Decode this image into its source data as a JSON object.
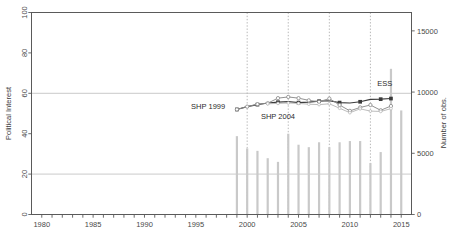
{
  "chart_data": {
    "type": "line",
    "title": "",
    "xlabel": "",
    "ylabel": "Political Interest",
    "y2label": "Number of obs.",
    "xlim": [
      1979,
      2016
    ],
    "ylim": [
      0,
      100
    ],
    "y2lim": [
      0,
      16500
    ],
    "grid": "horizontal solid at 20/60/100; vertical dashed at 2000/2004/2008/2012",
    "legend": "none (inline annotations)",
    "xticks": [
      1980,
      1985,
      1990,
      1995,
      2000,
      2005,
      2010,
      2015
    ],
    "xticks_minor": [
      1981,
      1982,
      1983,
      1984,
      1986,
      1987,
      1988,
      1989,
      1991,
      1992,
      1993,
      1994,
      1996,
      1997,
      1998,
      1999,
      2001,
      2002,
      2003,
      2004,
      2006,
      2007,
      2008,
      2009,
      2011,
      2012,
      2013,
      2014
    ],
    "yticks": [
      0,
      20,
      40,
      60,
      80,
      100
    ],
    "y2ticks": [
      0,
      5000,
      10000,
      15000
    ],
    "vgrid_years": [
      2000,
      2004,
      2008,
      2012
    ],
    "hgrid_values": [
      20,
      60,
      100
    ],
    "series": [
      {
        "name": "SHP 1999",
        "marker": "filled-square",
        "color": "#3b3b3b",
        "x": [
          1999,
          2000,
          2001,
          2002,
          2003,
          2004,
          2005,
          2006,
          2007,
          2008,
          2009,
          2010,
          2011,
          2012,
          2013,
          2014
        ],
        "values": [
          52.0,
          53.4,
          54.4,
          55.2,
          55.6,
          55.9,
          55.4,
          55.6,
          56.1,
          56.3,
          55.4,
          55.2,
          55.8,
          57.0,
          57.1,
          57.4
        ]
      },
      {
        "name": "SHP 2004",
        "marker": "open-circle",
        "color": "#8c8c8c",
        "x": [
          1999,
          2000,
          2001,
          2002,
          2003,
          2004,
          2005,
          2006,
          2007,
          2008,
          2009,
          2010,
          2011,
          2012,
          2013,
          2014
        ],
        "values": [
          52.0,
          53.4,
          54.6,
          55.1,
          57.6,
          58.2,
          57.6,
          56.5,
          55.8,
          57.4,
          54.2,
          51.3,
          53.0,
          54.2,
          51.6,
          53.7
        ]
      },
      {
        "name": "ESS",
        "marker": "open-circle-light",
        "color": "#b8b8b8",
        "x": [
          2002,
          2003,
          2004,
          2005,
          2006,
          2007,
          2008,
          2009,
          2010,
          2011,
          2012,
          2013,
          2014
        ],
        "values": [
          54.8,
          55.0,
          55.2,
          55.0,
          54.6,
          54.4,
          54.8,
          52.6,
          50.4,
          52.3,
          51.2,
          51.0,
          52.4
        ]
      }
    ],
    "bars": {
      "name": "Number of obs.",
      "color": "#c9c9c9",
      "x": [
        1999,
        2000,
        2001,
        2002,
        2003,
        2004,
        2005,
        2006,
        2007,
        2008,
        2009,
        2010,
        2011,
        2012,
        2013,
        2014,
        2015
      ],
      "values": [
        6400,
        5400,
        5200,
        4600,
        4300,
        6600,
        5700,
        5500,
        5900,
        5500,
        5900,
        6000,
        6000,
        4200,
        5100,
        11900,
        8500
      ]
    },
    "annotations": [
      {
        "text": "SHP 1999",
        "year": 1996.2,
        "value": 52.0
      },
      {
        "text": "SHP 2004",
        "year": 2003.0,
        "value": 47.5
      },
      {
        "text": "ESS",
        "year": 2013.4,
        "value": 63.5
      }
    ]
  },
  "axes": {
    "left_title": "Political Interest",
    "right_title": "Number of obs.",
    "left_tick_labels": [
      "0",
      "20",
      "40",
      "60",
      "80",
      "100"
    ],
    "right_tick_labels": [
      "0",
      "5000",
      "10000",
      "15000"
    ],
    "x_tick_labels": [
      "1980",
      "1985",
      "1990",
      "1995",
      "2000",
      "2005",
      "2010",
      "2015"
    ]
  },
  "colors": {
    "frame": "#5a5a5a",
    "gridline": "#c4c4c4",
    "dashed_grid": "#b0b0b0",
    "series_dark": "#3b3b3b",
    "series_mid": "#8c8c8c",
    "series_light": "#b8b8b8",
    "bars": "#c9c9c9",
    "background": "#ffffff"
  }
}
